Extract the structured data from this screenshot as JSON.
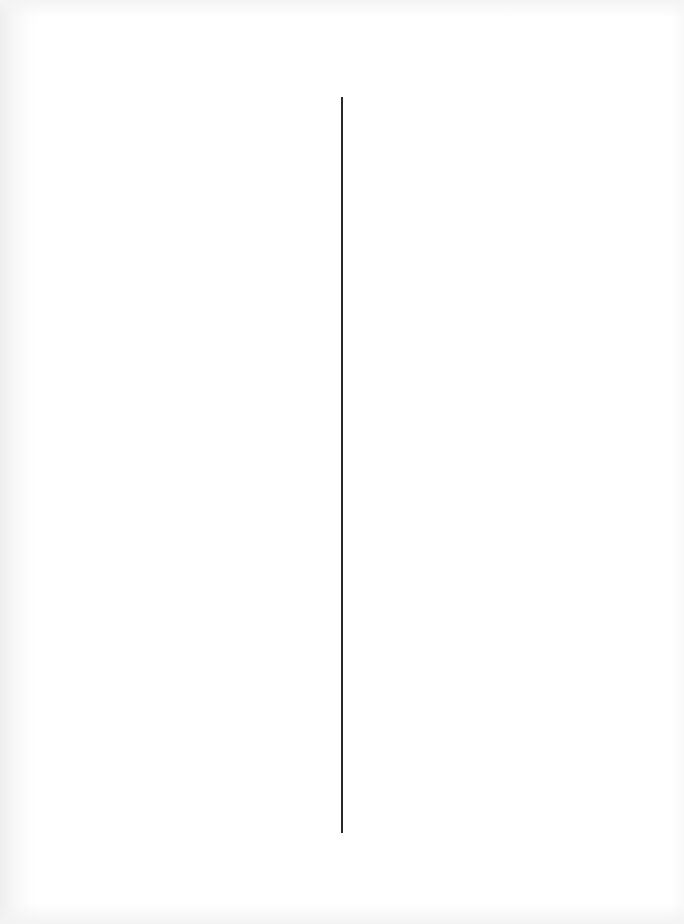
{
  "document": {
    "type": "blank scanned page",
    "layout": "two-column with vertical divider",
    "columns": {
      "left": {
        "text": ""
      },
      "right": {
        "text": ""
      }
    },
    "colors": {
      "paper": "#ffffff",
      "divider": "#2a2a2a",
      "edge_shadow": "#eeeeee"
    }
  }
}
